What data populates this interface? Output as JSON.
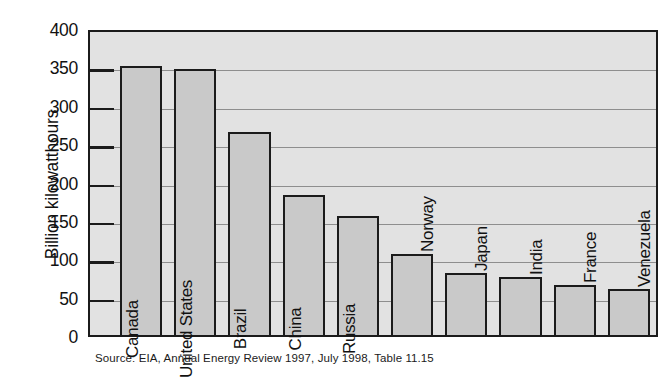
{
  "chart_data": {
    "type": "bar",
    "title": "",
    "xlabel": "",
    "ylabel": "Billion kilowatthours",
    "ylim": [
      0,
      400
    ],
    "yticks": [
      0,
      50,
      100,
      150,
      200,
      250,
      300,
      350,
      400
    ],
    "ytick_labels": [
      "0",
      "50",
      "100",
      "150",
      "200",
      "250",
      "300",
      "350",
      "400"
    ],
    "grid": true,
    "legend": "none",
    "categories": [
      "Canada",
      "United States",
      "Brazil",
      "China",
      "Russia",
      "Norway",
      "Japan",
      "India",
      "France",
      "Venezuela"
    ],
    "values": [
      351,
      347,
      265,
      183,
      155,
      105,
      81,
      75,
      65,
      60
    ],
    "label_placement": [
      "inside",
      "inside",
      "inside",
      "inside",
      "inside",
      "outside",
      "outside",
      "outside",
      "outside",
      "outside"
    ],
    "source": "Source:  EIA, Annual Energy Review 1997, July 1998, Table 11.15",
    "colors": {
      "bar_fill": "#c9c9c9",
      "bar_outline": "#1b1b1b",
      "plot_background": "#e2e2e2",
      "gridline": "#8e8e8e",
      "text": "#111111"
    }
  }
}
